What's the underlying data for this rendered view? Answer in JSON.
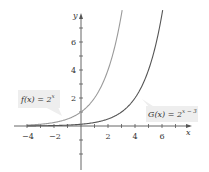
{
  "chart_data": {
    "type": "line",
    "title": "",
    "xlabel": "x",
    "ylabel": "y",
    "xlim": [
      -5,
      7.5
    ],
    "ylim": [
      -3,
      8
    ],
    "x_ticks": [
      -4,
      -2,
      2,
      4,
      6
    ],
    "x_tick_labels": [
      "−4",
      "−2",
      "2",
      "4",
      "6"
    ],
    "y_ticks": [
      2,
      4,
      6
    ],
    "y_tick_labels": [
      "2",
      "4",
      "6"
    ],
    "grid": false,
    "series": [
      {
        "name": "f(x) = 2^x",
        "formula": "2^x",
        "color": "#9a9a9a",
        "x": [
          -4,
          -3,
          -2,
          -1,
          0,
          1,
          2,
          2.9
        ],
        "values": [
          0.0625,
          0.125,
          0.25,
          0.5,
          1,
          2,
          4,
          7.46
        ]
      },
      {
        "name": "G(x) = 2^(x−3)",
        "formula": "2^(x-3)",
        "color": "#555555",
        "x": [
          -4,
          -2,
          0,
          1,
          2,
          3,
          4,
          5,
          5.9
        ],
        "values": [
          0.0078,
          0.031,
          0.125,
          0.25,
          0.5,
          1,
          2,
          4,
          7.46
        ]
      }
    ],
    "annotations": [
      {
        "text": "f(x) = 2^x",
        "points_to": "f"
      },
      {
        "text": "G(x) = 2^(x−3)",
        "points_to": "G"
      }
    ]
  },
  "labels": {
    "x_axis": "x",
    "y_axis": "y",
    "f_label_main": "f(x) = 2",
    "f_label_exp": "x",
    "g_label_main": "G(x) = 2",
    "g_label_exp": "x − 3",
    "xt": [
      "−4",
      "−2",
      "2",
      "4",
      "6"
    ],
    "yt": [
      "2",
      "4",
      "6"
    ]
  }
}
